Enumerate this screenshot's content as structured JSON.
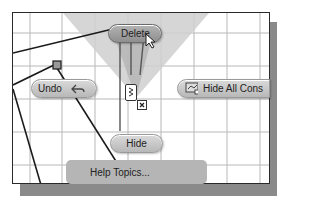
{
  "marking_menu": {
    "delete_label": "Delete",
    "undo_label": "Undo",
    "hide_all_label": "Hide All Cons",
    "hide_label": "Hide",
    "help_label": "Help Topics..."
  },
  "icons": {
    "undo": "undo-arrow-icon",
    "hide_all": "hide-all-constraints-icon",
    "constraint": "constraint-glyph-icon",
    "close": "close-small-icon",
    "cursor": "mouse-pointer-icon"
  },
  "colors": {
    "canvas_bg": "#ffffff",
    "grid_line": "#b8b8b8",
    "frame_border": "#2a2a2a",
    "shadow": "#8a8a8a",
    "cone": "#cfcfcf",
    "pill_bg": "#c8c8c8",
    "pill_highlight": "#9e9e9e"
  }
}
